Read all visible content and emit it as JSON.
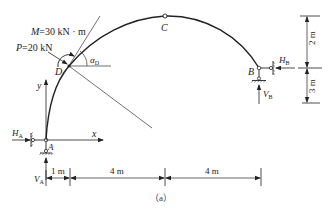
{
  "diagram": {
    "type": "three-hinged arch structural diagram",
    "caption": "（a）",
    "points": {
      "A": "A",
      "B": "B",
      "C": "C",
      "D": "D"
    },
    "loads": {
      "moment": {
        "label": "M=30 kN · m",
        "symbol": "M",
        "value": "30",
        "unit": "kN · m"
      },
      "force": {
        "label": "P=20 kN",
        "symbol": "P",
        "value": "20",
        "unit": "kN"
      }
    },
    "angle": {
      "label": "α",
      "subscript": "D"
    },
    "reactions": {
      "HA": {
        "symbol": "H",
        "subscript": "A"
      },
      "VA": {
        "symbol": "V",
        "subscript": "A"
      },
      "HB": {
        "symbol": "H",
        "subscript": "B"
      },
      "VB": {
        "symbol": "V",
        "subscript": "B"
      }
    },
    "axes": {
      "x": "x",
      "y": "y"
    },
    "dimensions": {
      "horizontal": [
        "1 m",
        "4 m",
        "4 m"
      ],
      "vertical": [
        "2 m",
        "3 m"
      ]
    },
    "colors": {
      "line": "#222222",
      "background": "#ffffff"
    }
  }
}
